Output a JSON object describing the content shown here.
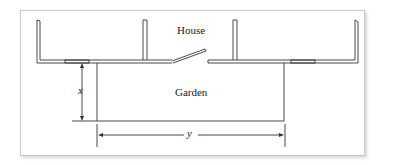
{
  "diagram": {
    "labels": {
      "house": "House",
      "garden": "Garden",
      "x": "x",
      "y": "y"
    },
    "colors": {
      "stroke": "#333333",
      "frame": "#c8c8c8"
    }
  }
}
